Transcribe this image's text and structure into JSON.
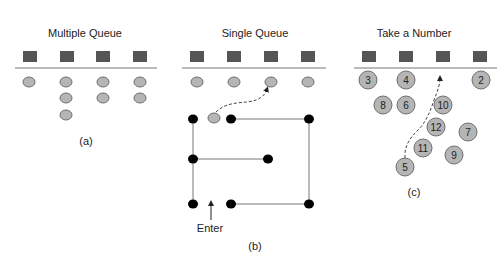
{
  "panels": {
    "a": {
      "title": "Multiple Queue",
      "caption": "(a)"
    },
    "b": {
      "title": "Single Queue",
      "caption": "(b)",
      "enter_label": "Enter"
    },
    "c": {
      "title": "Take a Number",
      "caption": "(c)",
      "tickets": [
        {
          "n": "3",
          "x": 368,
          "y": 80
        },
        {
          "n": "4",
          "x": 406,
          "y": 80
        },
        {
          "n": "2",
          "x": 481,
          "y": 80
        },
        {
          "n": "8",
          "x": 383,
          "y": 105
        },
        {
          "n": "6",
          "x": 406,
          "y": 105
        },
        {
          "n": "10",
          "x": 443,
          "y": 105
        },
        {
          "n": "12",
          "x": 436,
          "y": 127
        },
        {
          "n": "7",
          "x": 468,
          "y": 132
        },
        {
          "n": "11",
          "x": 423,
          "y": 148
        },
        {
          "n": "9",
          "x": 454,
          "y": 155
        },
        {
          "n": "5",
          "x": 405,
          "y": 167
        }
      ]
    }
  },
  "colors": {
    "server": "#555555",
    "customer": "#b5b5b5",
    "customer_stroke": "#6e6e6e",
    "line": "#777777",
    "stanchion": "#000000"
  }
}
